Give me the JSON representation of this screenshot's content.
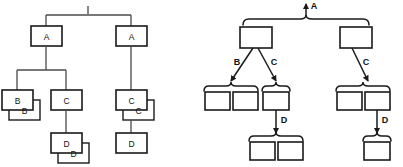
{
  "figure": {
    "title": "",
    "panels": [
      {
        "id": "left",
        "name": "instance-tree",
        "style": "labeled-boxes-stacked",
        "root_tick": "|",
        "nodes": [
          {
            "id": "L-A1",
            "label": "A",
            "x": 46,
            "y": 36,
            "stack": 1
          },
          {
            "id": "L-A2",
            "label": "A",
            "x": 131,
            "y": 36,
            "stack": 1
          },
          {
            "id": "L-B",
            "label": "B",
            "x": 17,
            "y": 100,
            "stack": 2
          },
          {
            "id": "L-C1",
            "label": "C",
            "x": 66,
            "y": 100,
            "stack": 1
          },
          {
            "id": "L-D1",
            "label": "D",
            "x": 66,
            "y": 143,
            "stack": 2
          },
          {
            "id": "L-C2",
            "label": "C",
            "x": 131,
            "y": 100,
            "stack": 2
          },
          {
            "id": "L-D2",
            "label": "D",
            "x": 131,
            "y": 143,
            "stack": 1
          }
        ],
        "edges": [
          {
            "from": "root-bar",
            "to": "L-A1"
          },
          {
            "from": "root-bar",
            "to": "L-A2"
          },
          {
            "from": "L-A1",
            "to": "L-B"
          },
          {
            "from": "L-A1",
            "to": "L-C1"
          },
          {
            "from": "L-C1",
            "to": "L-D1"
          },
          {
            "from": "L-A2",
            "to": "L-C2"
          },
          {
            "from": "L-C2",
            "to": "L-D2"
          }
        ]
      },
      {
        "id": "right",
        "name": "schema-tree",
        "style": "braced-groups-arrows",
        "root_arrow_label": "A",
        "groups": [
          {
            "id": "R-G0",
            "count": 2,
            "x": 25,
            "y": 30,
            "braced": true
          },
          {
            "id": "R-G1",
            "count": 2,
            "x": 8,
            "y": 96,
            "braced": true
          },
          {
            "id": "R-G2",
            "count": 1,
            "x": 62,
            "y": 96,
            "braced": true
          },
          {
            "id": "R-G3",
            "count": 2,
            "x": 48,
            "y": 145,
            "braced": true
          },
          {
            "id": "R-G4",
            "count": 2,
            "x": 140,
            "y": 96,
            "braced": true
          },
          {
            "id": "R-G5",
            "count": 1,
            "x": 168,
            "y": 145,
            "braced": true
          }
        ],
        "arrows": [
          {
            "from": "R-N0a",
            "to": "R-G1",
            "label": "B"
          },
          {
            "from": "R-N0a",
            "to": "R-G2",
            "label": "C"
          },
          {
            "from": "R-G2",
            "to": "R-G3",
            "label": "D"
          },
          {
            "from": "R-N0b",
            "to": "R-G4",
            "label": "C"
          },
          {
            "from": "R-G4",
            "to": "R-G5",
            "label": "D"
          }
        ]
      }
    ]
  },
  "labels": {
    "a": "A",
    "b": "B",
    "c": "C",
    "d": "D",
    "root_tick": "|"
  },
  "colors": {
    "background": "#ffffff",
    "box_stroke": "#1a1a1a",
    "edge_stroke": "#4a4a4a",
    "arrow_stroke": "#1a1a1a",
    "text": "#111111"
  }
}
